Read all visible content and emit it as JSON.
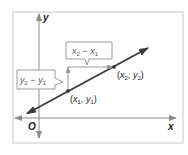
{
  "diagram": {
    "axes": {
      "x_label": "x",
      "y_label": "y",
      "origin_label": "O"
    },
    "points": [
      {
        "name": "point-1",
        "x_sub": "1",
        "y_sub": "1",
        "label_open": "(",
        "x": "x",
        "comma": ",",
        "y": "y",
        "label_close": ")"
      },
      {
        "name": "point-2",
        "x_sub": "2",
        "y_sub": "2",
        "label_open": "(",
        "x": "x",
        "comma": ",",
        "y": "y",
        "label_close": ")"
      }
    ],
    "callouts": {
      "run": {
        "a": "x",
        "a_sub": "2",
        "op": "−",
        "b": "x",
        "b_sub": "1"
      },
      "rise": {
        "a": "y",
        "a_sub": "2",
        "op": "−",
        "b": "y",
        "b_sub": "1"
      }
    },
    "colors": {
      "frame": "#c8c8c8",
      "axis": "#8a8a8a",
      "line": "#3a3a3a",
      "rise_run_arrow": "#9a9a9a",
      "callout_border": "#9a9a9a",
      "text": "#222222"
    }
  }
}
